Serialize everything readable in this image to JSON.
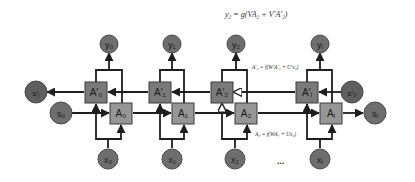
{
  "diagram": {
    "type": "bidirectional-rnn",
    "equations": {
      "output": "y₂ = g(VA₂ + V′A′₂)",
      "backward": "A′₂ = f(W′A′₂ + U′x₂)",
      "forward": "A₂ = f(WA₁ + Ux₂)"
    },
    "ellipsis": "...",
    "outputs": [
      {
        "id": "y0",
        "label": "y₀"
      },
      {
        "id": "y1",
        "label": "y₁"
      },
      {
        "id": "y2",
        "label": "y₂"
      },
      {
        "id": "yi",
        "label": "yᵢ"
      }
    ],
    "backward_cells": [
      {
        "id": "A0p",
        "label": "A′₀"
      },
      {
        "id": "A1p",
        "label": "A′₁"
      },
      {
        "id": "A2p",
        "label": "A′₂"
      },
      {
        "id": "Aip",
        "label": "A′ᵢ"
      }
    ],
    "forward_cells": [
      {
        "id": "A0",
        "label": "A₀"
      },
      {
        "id": "A1",
        "label": "A₁"
      },
      {
        "id": "A2",
        "label": "A₂"
      },
      {
        "id": "Ai",
        "label": "Aᵢ"
      }
    ],
    "inputs": [
      {
        "id": "x0",
        "label": "x₀"
      },
      {
        "id": "x1",
        "label": "x₁"
      },
      {
        "id": "x2",
        "label": "x₂"
      },
      {
        "id": "xi",
        "label": "xᵢ"
      }
    ],
    "states": {
      "s0": "s₀",
      "si": "sᵢ",
      "s_prime_i": "s′ᵢ",
      "s_prime_0": "s′₀"
    },
    "colors": {
      "circle_fill": "#6e6e6e",
      "circle_stroke": "#4a4a4a",
      "backward_box_fill": "#7a7a7a",
      "forward_box_fill": "#969696",
      "box_stroke": "#3c3c3c",
      "line": "#1e1e1e"
    }
  }
}
